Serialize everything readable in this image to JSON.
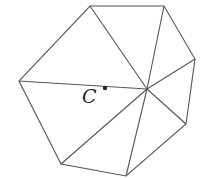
{
  "diagram": {
    "vertices": [
      [
        90,
        6
      ],
      [
        164,
        6
      ],
      [
        195,
        59
      ],
      [
        186,
        124
      ],
      [
        126,
        176
      ],
      [
        61,
        164
      ],
      [
        19,
        81
      ]
    ],
    "hub": [
      147,
      89
    ],
    "point": {
      "label": "C",
      "x": 105,
      "y": 88
    },
    "colors": {
      "stroke": "#555555",
      "text": "#222222",
      "background": "#ffffff"
    }
  }
}
